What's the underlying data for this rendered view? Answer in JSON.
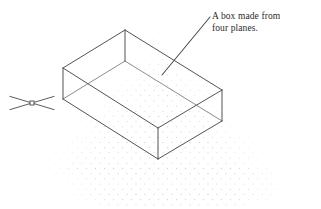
{
  "diagram": {
    "annotation": {
      "line1": "A box made from",
      "line2": "four planes.",
      "leader": {
        "from_x": 162,
        "from_y": 75,
        "to_x": 210,
        "to_y": 17
      }
    },
    "colors": {
      "line": "#4a4a4a",
      "line_light": "#6e6e6e",
      "grid_dot": "#c9c9cf",
      "text": "#2b2b2b",
      "background": "#ffffff"
    },
    "point_marker": {
      "name": "node-point-marker",
      "center_x": 32,
      "center_y": 103,
      "arm_length": 22,
      "grip_size": 4
    },
    "grid": {
      "type": "isometric-dot-snap",
      "dot_radius": 0.55,
      "col_spacing": 9,
      "row_spacing": 5.2,
      "origin_x": 46,
      "origin_y": 28,
      "cols": 34,
      "rows": 36
    },
    "box": {
      "shape": "rectangular open-top box (four vertical planes, no lid, no floor drawn as solid)",
      "height": 31,
      "top_face": {
        "apex_top": {
          "x": 125,
          "y": 30
        },
        "apex_left": {
          "x": 63,
          "y": 68
        },
        "apex_bottom": {
          "x": 158,
          "y": 128
        },
        "apex_right": {
          "x": 222,
          "y": 90
        }
      },
      "inner_face": {
        "apex_top": {
          "x": 125,
          "y": 61
        },
        "apex_left": {
          "x": 63,
          "y": 99
        },
        "apex_bottom": {
          "x": 158,
          "y": 159
        },
        "apex_right": {
          "x": 222,
          "y": 121
        }
      },
      "vertical_edges": [
        {
          "x": 63,
          "y1": 68,
          "y2": 99
        },
        {
          "x": 125,
          "y1": 30,
          "y2": 61
        },
        {
          "x": 158,
          "y1": 128,
          "y2": 159
        },
        {
          "x": 222,
          "y1": 90,
          "y2": 121
        }
      ]
    }
  }
}
